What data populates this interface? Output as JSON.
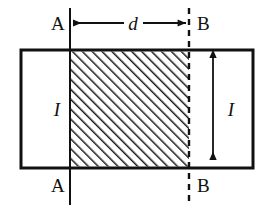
{
  "figure": {
    "background_color": "#ffffff",
    "line_color": "#111111",
    "hatch_color": "#1a1a1a",
    "labels": {
      "top_left": "A",
      "top_right": "B",
      "bottom_left": "A",
      "bottom_right": "B",
      "width_dimension": "d",
      "left_height": "I",
      "right_height": "I"
    },
    "geometry": {
      "rect_left": 21,
      "rect_top": 50,
      "rect_right": 253,
      "rect_bottom": 168,
      "section_line_a_x": 70,
      "section_line_b_x": 189,
      "section_line_top": 8,
      "section_line_bottom": 205,
      "dimension_arrow_y": 23,
      "height_arrow_x": 213,
      "hatch_angle_degrees": 45,
      "hatch_spacing": 7,
      "outline_stroke_width": 3
    }
  }
}
